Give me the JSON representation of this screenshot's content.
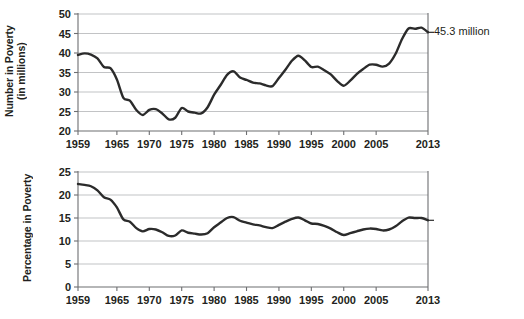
{
  "figure": {
    "background": "#ffffff",
    "line_color": "#2b2b2b",
    "grid_color": "#a7a9ac",
    "axis_color": "#6d6e71",
    "text_color": "#231f20"
  },
  "panels": [
    {
      "id": "top",
      "ylabel": "Number in Poverty\n(in millions)",
      "callout": "45.3 million"
    },
    {
      "id": "bottom",
      "ylabel": "Percentage in Poverty",
      "callout": "14.5 percent"
    }
  ],
  "chart_data": [
    {
      "type": "line",
      "title": "",
      "subtitle": "",
      "xlabel": "",
      "ylabel": "Number in Poverty (in millions)",
      "xlim": [
        1959,
        2013
      ],
      "ylim": [
        20,
        50
      ],
      "yticks": [
        20,
        25,
        30,
        35,
        40,
        45,
        50
      ],
      "xticks": [
        1959,
        1965,
        1970,
        1975,
        1980,
        1985,
        1990,
        1995,
        2000,
        2005,
        2013
      ],
      "xtick_labels": [
        "1959",
        "1965",
        "1970",
        "1975",
        "1980",
        "1985",
        "1990",
        "1995",
        "2000",
        "2005",
        "2013"
      ],
      "ytick_labels": [
        "20",
        "25",
        "30",
        "35",
        "40",
        "45",
        "50"
      ],
      "grid": "horizontal",
      "legend": "none",
      "annotations": [
        {
          "text": "45.3 million",
          "x": 2013,
          "y": 45.3,
          "position": "right"
        }
      ],
      "x": [
        1959,
        1960,
        1961,
        1962,
        1963,
        1964,
        1965,
        1966,
        1967,
        1968,
        1969,
        1970,
        1971,
        1972,
        1973,
        1974,
        1975,
        1976,
        1977,
        1978,
        1979,
        1980,
        1981,
        1982,
        1983,
        1984,
        1985,
        1986,
        1987,
        1988,
        1989,
        1990,
        1991,
        1992,
        1993,
        1994,
        1995,
        1996,
        1997,
        1998,
        1999,
        2000,
        2001,
        2002,
        2003,
        2004,
        2005,
        2006,
        2007,
        2008,
        2009,
        2010,
        2011,
        2012,
        2013
      ],
      "values": [
        39.5,
        39.9,
        39.6,
        38.6,
        36.4,
        36.1,
        33.2,
        28.5,
        27.8,
        25.4,
        24.1,
        25.4,
        25.6,
        24.5,
        23.0,
        23.4,
        25.9,
        25.0,
        24.7,
        24.5,
        26.1,
        29.3,
        31.8,
        34.4,
        35.3,
        33.7,
        33.1,
        32.4,
        32.2,
        31.7,
        31.5,
        33.6,
        35.7,
        38.0,
        39.3,
        38.1,
        36.4,
        36.5,
        35.6,
        34.5,
        32.8,
        31.6,
        32.9,
        34.6,
        35.9,
        37.0,
        37.0,
        36.5,
        37.3,
        39.8,
        43.6,
        46.3,
        46.2,
        46.5,
        45.3
      ],
      "series": [
        {
          "name": "Number in Poverty (millions)",
          "color": "#2b2b2b",
          "values": [
            39.5,
            39.9,
            39.6,
            38.6,
            36.4,
            36.1,
            33.2,
            28.5,
            27.8,
            25.4,
            24.1,
            25.4,
            25.6,
            24.5,
            23.0,
            23.4,
            25.9,
            25.0,
            24.7,
            24.5,
            26.1,
            29.3,
            31.8,
            34.4,
            35.3,
            33.7,
            33.1,
            32.4,
            32.2,
            31.7,
            31.5,
            33.6,
            35.7,
            38.0,
            39.3,
            38.1,
            36.4,
            36.5,
            35.6,
            34.5,
            32.8,
            31.6,
            32.9,
            34.6,
            35.9,
            37.0,
            37.0,
            36.5,
            37.3,
            39.8,
            43.6,
            46.3,
            46.2,
            46.5,
            45.3
          ]
        }
      ]
    },
    {
      "type": "line",
      "title": "",
      "subtitle": "",
      "xlabel": "",
      "ylabel": "Percentage in Poverty",
      "xlim": [
        1959,
        2013
      ],
      "ylim": [
        0,
        25
      ],
      "yticks": [
        0,
        5,
        10,
        15,
        20,
        25
      ],
      "xticks": [
        1959,
        1965,
        1970,
        1975,
        1980,
        1985,
        1990,
        1995,
        2000,
        2005,
        2013
      ],
      "xtick_labels": [
        "1959",
        "1965",
        "1970",
        "1975",
        "1980",
        "1985",
        "1990",
        "1995",
        "2000",
        "2005",
        "2013"
      ],
      "ytick_labels": [
        "0",
        "5",
        "10",
        "15",
        "20",
        "25"
      ],
      "grid": "horizontal",
      "legend": "none",
      "annotations": [
        {
          "text": "14.5 percent",
          "x": 2013,
          "y": 14.5,
          "position": "right"
        }
      ],
      "x": [
        1959,
        1960,
        1961,
        1962,
        1963,
        1964,
        1965,
        1966,
        1967,
        1968,
        1969,
        1970,
        1971,
        1972,
        1973,
        1974,
        1975,
        1976,
        1977,
        1978,
        1979,
        1980,
        1981,
        1982,
        1983,
        1984,
        1985,
        1986,
        1987,
        1988,
        1989,
        1990,
        1991,
        1992,
        1993,
        1994,
        1995,
        1996,
        1997,
        1998,
        1999,
        2000,
        2001,
        2002,
        2003,
        2004,
        2005,
        2006,
        2007,
        2008,
        2009,
        2010,
        2011,
        2012,
        2013
      ],
      "values": [
        22.4,
        22.2,
        21.9,
        21.0,
        19.5,
        19.0,
        17.3,
        14.7,
        14.2,
        12.8,
        12.1,
        12.6,
        12.5,
        11.9,
        11.1,
        11.2,
        12.3,
        11.8,
        11.6,
        11.4,
        11.7,
        13.0,
        14.0,
        15.0,
        15.2,
        14.4,
        14.0,
        13.6,
        13.4,
        13.0,
        12.8,
        13.5,
        14.2,
        14.8,
        15.1,
        14.5,
        13.8,
        13.7,
        13.3,
        12.7,
        11.9,
        11.3,
        11.7,
        12.1,
        12.5,
        12.7,
        12.6,
        12.3,
        12.5,
        13.2,
        14.3,
        15.1,
        15.0,
        15.0,
        14.5
      ],
      "series": [
        {
          "name": "Percentage in Poverty",
          "color": "#2b2b2b",
          "values": [
            22.4,
            22.2,
            21.9,
            21.0,
            19.5,
            19.0,
            17.3,
            14.7,
            14.2,
            12.8,
            12.1,
            12.6,
            12.5,
            11.9,
            11.1,
            11.2,
            12.3,
            11.8,
            11.6,
            11.4,
            11.7,
            13.0,
            14.0,
            15.0,
            15.2,
            14.4,
            14.0,
            13.6,
            13.4,
            13.0,
            12.8,
            13.5,
            14.2,
            14.8,
            15.1,
            14.5,
            13.8,
            13.7,
            13.3,
            12.7,
            11.9,
            11.3,
            11.7,
            12.1,
            12.5,
            12.7,
            12.6,
            12.3,
            12.5,
            13.2,
            14.3,
            15.1,
            15.0,
            15.0,
            14.5
          ]
        }
      ]
    }
  ]
}
